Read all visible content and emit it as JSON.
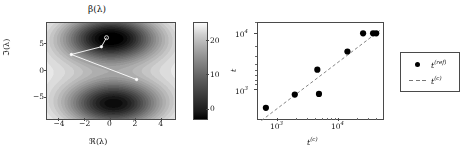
{
  "figure": {
    "background": "#ffffff",
    "accent": "#000000"
  },
  "left_panel": {
    "title": "β(λ)",
    "xlabel": "ℜ(λ)",
    "ylabel": "ℑ(λ)",
    "xticks": [
      "−4",
      "−2",
      "0",
      "2",
      "4"
    ],
    "yticks": [
      "5",
      "0",
      "−5"
    ],
    "colorbar": {
      "ticks": [
        "20",
        "10",
        "0"
      ],
      "low_color": "#000000",
      "high_color": "#ffffff"
    },
    "path_color": "#ffffff",
    "marker_color": "#ffffff"
  },
  "right_panel": {
    "xlabel": "t",
    "xlabel_sup": "(c)",
    "ylabel": "t",
    "xticks": [
      "10",
      "10"
    ],
    "xticks_exp": [
      "3",
      "4"
    ],
    "yticks": [
      "10",
      "10"
    ],
    "yticks_exp": [
      "4",
      "3"
    ],
    "legend": [
      {
        "glyph": "marker-dot",
        "label": "t",
        "label_sup": "(ref)"
      },
      {
        "glyph": "dashed-line",
        "label": "t",
        "label_sup": "(c)"
      }
    ],
    "marker_color": "#000000",
    "line_color": "#777777"
  },
  "chart_data": [
    {
      "type": "heatmap",
      "title": "β(λ)",
      "xlabel": "ℜ(λ)",
      "ylabel": "ℑ(λ)",
      "xlim": [
        -5,
        5
      ],
      "ylim": [
        -9,
        9
      ],
      "xtick_values": [
        -4,
        -2,
        0,
        2,
        4
      ],
      "ytick_values": [
        5,
        0,
        -5
      ],
      "colormap": "gray",
      "cbar_range": [
        0,
        25
      ],
      "cbar_tick_values": [
        20,
        10,
        0
      ],
      "grid": false,
      "minima": [
        {
          "x": 0.0,
          "y": 6.2,
          "value": 0
        },
        {
          "x": 0.2,
          "y": -6.2,
          "value": 2
        }
      ],
      "overlay_path": {
        "name": "optimization-path",
        "color": "#ffffff",
        "points": [
          {
            "x": 2.0,
            "y": -1.6
          },
          {
            "x": -3.1,
            "y": 3.1
          },
          {
            "x": -0.75,
            "y": 4.55
          },
          {
            "x": -0.35,
            "y": 6.25
          }
        ]
      }
    },
    {
      "type": "scatter",
      "title": "",
      "xlabel": "t^(c)",
      "ylabel": "t",
      "xscale": "log",
      "yscale": "log",
      "xlim": [
        500,
        32000
      ],
      "ylim": [
        600,
        40000
      ],
      "xtick_values": [
        1000,
        10000
      ],
      "ytick_values": [
        1000,
        10000
      ],
      "grid": false,
      "legend_position": "right-outside",
      "series": [
        {
          "name": "t^(ref)",
          "type": "scatter",
          "marker": "o",
          "color": "#000000",
          "x": [
            650,
            1700,
            3600,
            3800,
            9800,
            16500,
            23000,
            25500
          ],
          "y": [
            980,
            1750,
            5200,
            1800,
            11500,
            25500,
            25500,
            25500
          ]
        },
        {
          "name": "t^(c)",
          "type": "line",
          "linestyle": "dashed",
          "color": "#777777",
          "x": [
            560,
            30000
          ],
          "y": [
            560,
            30000
          ]
        }
      ]
    }
  ]
}
